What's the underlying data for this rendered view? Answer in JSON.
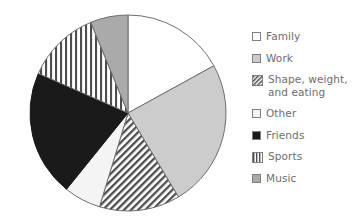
{
  "chart_data": {
    "type": "pie",
    "title": "",
    "subtitle": "",
    "xlabel": "",
    "ylabel": "",
    "grid": false,
    "legend_position": "right",
    "start_angle_deg": 0,
    "direction": "clockwise",
    "center": {
      "cx": 128,
      "cy": 113
    },
    "radius": 98,
    "categories": [
      "Family",
      "Work",
      "Shape, weight, and eating",
      "Other",
      "Friends",
      "Sports",
      "Music"
    ],
    "values": [
      17.0,
      24.4,
      13.3,
      6.1,
      20.8,
      12.2,
      6.2
    ],
    "angles_deg": [
      61.2,
      87.8,
      47.9,
      22.0,
      74.9,
      43.9,
      22.3
    ],
    "slices": [
      {
        "label": "Family",
        "value": 17.0,
        "angle_deg": 61.2,
        "start_deg": 0.0,
        "end_deg": 61.2,
        "fill": "#ffffff",
        "pattern": "solid",
        "stroke": "#6e6e6e"
      },
      {
        "label": "Work",
        "value": 24.4,
        "angle_deg": 87.8,
        "start_deg": 61.2,
        "end_deg": 149.0,
        "fill": "#cccccc",
        "pattern": "solid",
        "stroke": "#6e6e6e"
      },
      {
        "label": "Shape, weight, and eating",
        "value": 13.3,
        "angle_deg": 47.9,
        "start_deg": 149.0,
        "end_deg": 196.9,
        "fill": "#ffffff",
        "pattern": "diagonal-hatch",
        "stroke": "#6e6e6e"
      },
      {
        "label": "Other",
        "value": 6.1,
        "angle_deg": 22.0,
        "start_deg": 196.9,
        "end_deg": 218.9,
        "fill": "#f4f4f4",
        "pattern": "solid",
        "stroke": "#6e6e6e"
      },
      {
        "label": "Friends",
        "value": 20.8,
        "angle_deg": 74.9,
        "start_deg": 218.9,
        "end_deg": 293.8,
        "fill": "#1a1a1a",
        "pattern": "solid",
        "stroke": "#1a1a1a"
      },
      {
        "label": "Sports",
        "value": 12.2,
        "angle_deg": 43.9,
        "start_deg": 293.8,
        "end_deg": 337.7,
        "fill": "#ffffff",
        "pattern": "vertical-stripes",
        "stroke": "#6e6e6e"
      },
      {
        "label": "Music",
        "value": 6.2,
        "angle_deg": 22.3,
        "start_deg": 337.7,
        "end_deg": 360.0,
        "fill": "#aaaaaa",
        "pattern": "solid",
        "stroke": "#6e6e6e"
      }
    ]
  },
  "legend": {
    "items": [
      {
        "label": "Family",
        "swatch": "white-square",
        "fill": "#ffffff",
        "pattern": "solid"
      },
      {
        "label": "Work",
        "swatch": "light-gray-square",
        "fill": "#cccccc",
        "pattern": "solid"
      },
      {
        "label": "Shape, weight,\nand eating",
        "swatch": "diagonal-hatch-square",
        "fill": "#ffffff",
        "pattern": "diagonal-hatch"
      },
      {
        "label": "Other",
        "swatch": "white-square",
        "fill": "#f4f4f4",
        "pattern": "solid"
      },
      {
        "label": "Friends",
        "swatch": "black-square",
        "fill": "#1a1a1a",
        "pattern": "solid"
      },
      {
        "label": "Sports",
        "swatch": "vertical-stripes-square",
        "fill": "#ffffff",
        "pattern": "vertical-stripes"
      },
      {
        "label": "Music",
        "swatch": "medium-gray-square",
        "fill": "#aaaaaa",
        "pattern": "solid"
      }
    ]
  },
  "colors": {
    "text": "#6e6e6e",
    "outline": "#6e6e6e",
    "background": "#ffffff"
  }
}
